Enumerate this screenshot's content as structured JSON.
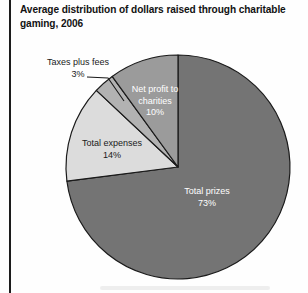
{
  "header": {
    "title_line1": "Average distribution of dollars raised through charitable",
    "title_line2": "gaming, 2006"
  },
  "chart_data": {
    "type": "pie",
    "title": "Average distribution of dollars raised through charitable gaming, 2006",
    "units": "percent",
    "start_angle_deg": 0,
    "direction": "clockwise",
    "legend": "none (labels on slices)",
    "outline_color": "#1a1a1a",
    "background_color": "#fefefe",
    "slices": [
      {
        "label": "Total prizes",
        "pct_label": "73%",
        "value": 73,
        "color": "#747474",
        "text_color": "#ffffff",
        "label_placement": "inside"
      },
      {
        "label": "Total expenses",
        "pct_label": "14%",
        "value": 14,
        "color": "#dcdcdc",
        "text_color": "#1a1a1a",
        "label_placement": "inside"
      },
      {
        "label": "Taxes plus fees",
        "pct_label": "3%",
        "value": 3,
        "color": "#b2b2b2",
        "text_color": "#1a1a1a",
        "label_placement": "outside-callout"
      },
      {
        "label": "Net profit to charities",
        "pct_label": "10%",
        "value": 10,
        "color": "#9b9b9b",
        "text_color": "#ffffff",
        "label_placement": "inside"
      }
    ]
  }
}
